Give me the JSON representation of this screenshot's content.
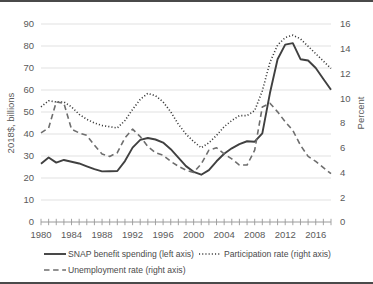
{
  "chart_data": {
    "type": "line",
    "title": "",
    "xlabel": "",
    "ylabel": "2018$, billions",
    "y2label": "Percent",
    "ylim": [
      0,
      90
    ],
    "y2lim": [
      0,
      16
    ],
    "xlim": [
      1980,
      2018
    ],
    "yticks": [
      0,
      10,
      20,
      30,
      40,
      50,
      60,
      70,
      80,
      90
    ],
    "y2ticks": [
      0,
      2,
      4,
      6,
      8,
      10,
      12,
      14,
      16
    ],
    "xticks_labeled": [
      1980,
      1984,
      1988,
      1992,
      1996,
      2000,
      2004,
      2008,
      2012,
      2016
    ],
    "xticks_minor_step": 1,
    "grid": "horizontal",
    "legend_position": "bottom",
    "x": [
      1980,
      1981,
      1982,
      1983,
      1984,
      1985,
      1986,
      1987,
      1988,
      1989,
      1990,
      1991,
      1992,
      1993,
      1994,
      1995,
      1996,
      1997,
      1998,
      1999,
      2000,
      2001,
      2002,
      2003,
      2004,
      2005,
      2006,
      2007,
      2008,
      2009,
      2010,
      2011,
      2012,
      2013,
      2014,
      2015,
      2016,
      2017,
      2018
    ],
    "series": [
      {
        "name": "SNAP benefit spending (left axis)",
        "axis": "left",
        "style": "solid",
        "color": "#404040",
        "values": [
          26.5,
          29.3,
          27.0,
          28.2,
          27.4,
          26.6,
          25.3,
          24.0,
          23.0,
          23.1,
          23.2,
          27.7,
          33.8,
          37.3,
          38.2,
          37.5,
          36.1,
          33.1,
          29.3,
          25.4,
          22.8,
          21.5,
          23.6,
          27.6,
          31.0,
          33.5,
          35.4,
          36.7,
          36.5,
          40.3,
          58.6,
          74.0,
          80.6,
          81.3,
          74.0,
          73.4,
          70.0,
          65.0,
          60.1
        ]
      },
      {
        "name": "Participation rate (right axis)",
        "axis": "right",
        "style": "dotted",
        "color": "#3a3a3a",
        "values": [
          9.3,
          9.8,
          9.7,
          9.7,
          9.3,
          8.7,
          8.3,
          8.0,
          7.8,
          7.7,
          7.6,
          8.2,
          9.1,
          9.9,
          10.4,
          10.2,
          9.7,
          8.9,
          7.9,
          7.1,
          6.5,
          6.0,
          6.4,
          7.0,
          7.7,
          8.2,
          8.6,
          8.6,
          9.0,
          10.6,
          12.9,
          14.3,
          14.9,
          15.1,
          14.8,
          14.2,
          13.6,
          13.0,
          12.4
        ]
      },
      {
        "name": "Unemployment rate (right axis)",
        "axis": "right",
        "style": "dashed",
        "color": "#6e6e6e",
        "values": [
          7.2,
          7.6,
          9.7,
          9.6,
          7.5,
          7.2,
          7.0,
          6.2,
          5.5,
          5.3,
          5.6,
          6.8,
          7.5,
          6.9,
          6.1,
          5.6,
          5.4,
          4.9,
          4.5,
          4.2,
          4.0,
          4.7,
          5.8,
          6.0,
          5.5,
          5.1,
          4.6,
          4.6,
          5.8,
          9.3,
          9.6,
          8.9,
          8.1,
          7.4,
          6.2,
          5.3,
          4.9,
          4.4,
          3.9
        ]
      }
    ]
  },
  "legend": {
    "items": [
      {
        "label": "SNAP benefit spending (left axis)",
        "style": "solid"
      },
      {
        "label": "Participation rate (right axis)",
        "style": "dotted"
      },
      {
        "label": "Unemployment rate (right axis)",
        "style": "dashed"
      }
    ]
  },
  "axes": {
    "left_title": "2018$, billions",
    "right_title": "Percent"
  }
}
